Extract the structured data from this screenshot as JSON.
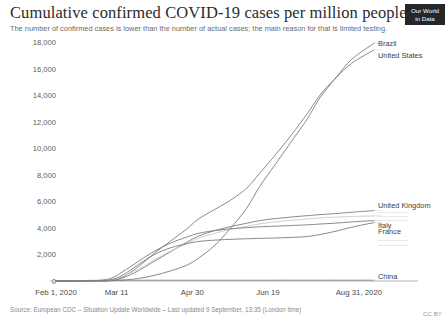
{
  "header": {
    "title": "Cumulative confirmed COVID-19 cases per million people",
    "subtitle": "The number of confirmed cases is lower than the number of actual cases; the main reason for that is limited testing.",
    "logo_line1": "Our World",
    "logo_line2": "in Data"
  },
  "footer": {
    "source": "Source: European CDC – Situation Update Worldwide – Last updated 9 September, 13:35 (London time)",
    "license": "CC BY"
  },
  "colors": {
    "line": "#7c7c7c",
    "axis": "#b5b5b5",
    "label": "#3d3d3d",
    "faded_label": "#d8d8d8",
    "logo_bg": "#23272c"
  },
  "chart_data": {
    "type": "line",
    "title": "Cumulative confirmed COVID-19 cases per million people",
    "subtitle": "The number of confirmed cases is lower than the number of actual cases; the main reason for that is limited testing.",
    "xlabel": "",
    "ylabel": "",
    "ylim": [
      0,
      18000
    ],
    "yticks": [
      0,
      2000,
      4000,
      6000,
      8000,
      10000,
      12000,
      14000,
      16000,
      18000
    ],
    "ytick_labels": [
      "0",
      "2,000",
      "4,000",
      "6,000",
      "8,000",
      "10,000",
      "12,000",
      "14,000",
      "16,000",
      "18,000"
    ],
    "xtick_labels": [
      "Feb 1, 2020",
      "Mar 11",
      "Apr 30",
      "Jun 19",
      "Aug 31, 2020"
    ],
    "xtick_positions": [
      0,
      0.1905,
      0.4286,
      0.6667,
      0.9524
    ],
    "x_start": "Feb 1, 2020",
    "x_end": "Aug 31, 2020",
    "grid": false,
    "legend_position": "right-inline",
    "series": [
      {
        "name": "Brazil",
        "label_value": 17900,
        "x": [
          0,
          0.06,
          0.12,
          0.17,
          0.21,
          0.26,
          0.31,
          0.36,
          0.41,
          0.45,
          0.5,
          0.55,
          0.6,
          0.64,
          0.69,
          0.74,
          0.79,
          0.83,
          0.88,
          0.93,
          1.0
        ],
        "values": [
          0,
          0,
          2,
          15,
          70,
          190,
          430,
          760,
          1180,
          1750,
          2700,
          4000,
          5500,
          7100,
          8800,
          10500,
          12200,
          13800,
          15300,
          16700,
          17900
        ]
      },
      {
        "name": "United States",
        "label_value": 17400,
        "x": [
          0,
          0.06,
          0.12,
          0.17,
          0.21,
          0.26,
          0.31,
          0.36,
          0.41,
          0.45,
          0.5,
          0.55,
          0.6,
          0.64,
          0.69,
          0.74,
          0.79,
          0.83,
          0.88,
          0.93,
          1.0
        ],
        "values": [
          0,
          0,
          3,
          40,
          300,
          1100,
          2100,
          3000,
          3900,
          4700,
          5400,
          6100,
          7000,
          8100,
          9500,
          11000,
          12600,
          14000,
          15300,
          16400,
          17400
        ]
      },
      {
        "name": "United Kingdom",
        "label_value": 5300,
        "x": [
          0,
          0.06,
          0.12,
          0.17,
          0.21,
          0.26,
          0.31,
          0.36,
          0.41,
          0.45,
          0.5,
          0.55,
          0.6,
          0.64,
          0.69,
          0.74,
          0.79,
          0.83,
          0.88,
          0.93,
          1.0
        ],
        "values": [
          0,
          0,
          2,
          30,
          230,
          780,
          1500,
          2200,
          2900,
          3400,
          3800,
          4100,
          4350,
          4550,
          4700,
          4820,
          4920,
          5000,
          5080,
          5180,
          5300
        ]
      },
      {
        "name": "",
        "label_value": 4900,
        "faded": true,
        "x": [
          0,
          0.06,
          0.12,
          0.17,
          0.21,
          0.26,
          0.31,
          0.36,
          0.41,
          0.45,
          0.5,
          0.55,
          0.6,
          0.64,
          0.69,
          0.74,
          0.79,
          0.83,
          0.88,
          0.93,
          1.0
        ],
        "values": [
          0,
          0,
          5,
          60,
          350,
          900,
          1600,
          2250,
          2800,
          3250,
          3600,
          3900,
          4120,
          4300,
          4450,
          4570,
          4670,
          4750,
          4810,
          4860,
          4900
        ]
      },
      {
        "name": "Italy",
        "label_value": 4550,
        "x": [
          0,
          0.06,
          0.12,
          0.17,
          0.21,
          0.26,
          0.31,
          0.36,
          0.41,
          0.45,
          0.5,
          0.55,
          0.6,
          0.64,
          0.69,
          0.74,
          0.79,
          0.83,
          0.88,
          0.93,
          1.0
        ],
        "values": [
          0,
          1,
          20,
          180,
          700,
          1500,
          2250,
          2850,
          3300,
          3600,
          3800,
          3930,
          4020,
          4080,
          4130,
          4180,
          4230,
          4290,
          4360,
          4450,
          4550
        ]
      },
      {
        "name": "France",
        "label_value": 4400,
        "x": [
          0,
          0.06,
          0.12,
          0.17,
          0.21,
          0.26,
          0.31,
          0.36,
          0.41,
          0.45,
          0.5,
          0.55,
          0.6,
          0.64,
          0.69,
          0.74,
          0.79,
          0.83,
          0.88,
          0.93,
          1.0
        ],
        "values": [
          0,
          0,
          6,
          80,
          450,
          1250,
          2000,
          2500,
          2800,
          2980,
          3080,
          3140,
          3180,
          3210,
          3240,
          3280,
          3350,
          3500,
          3750,
          4050,
          4400
        ]
      },
      {
        "name": "China",
        "label_value": 60,
        "x": [
          0,
          0.06,
          0.12,
          0.17,
          0.21,
          0.26,
          0.31,
          0.36,
          0.41,
          0.45,
          0.5,
          0.55,
          0.6,
          0.64,
          0.69,
          0.74,
          0.79,
          0.83,
          0.88,
          0.93,
          1.0
        ],
        "values": [
          8,
          30,
          50,
          56,
          57,
          58,
          58,
          58,
          58,
          59,
          59,
          59,
          59,
          59,
          60,
          60,
          60,
          60,
          60,
          60,
          60
        ]
      }
    ],
    "inline_labels": [
      {
        "name": "Brazil",
        "y": 17900,
        "faded": false
      },
      {
        "name": "United States",
        "y": 17000,
        "faded": false
      },
      {
        "name": "United Kingdom",
        "y": 5700,
        "faded": false
      },
      {
        "name": "",
        "y": 5250,
        "faded": true
      },
      {
        "name": "",
        "y": 4950,
        "faded": true
      },
      {
        "name": "",
        "y": 4650,
        "faded": true
      },
      {
        "name": "Italy",
        "y": 4200,
        "faded": false
      },
      {
        "name": "France",
        "y": 3750,
        "faded": false
      },
      {
        "name": "",
        "y": 3200,
        "faded": true
      },
      {
        "name": "",
        "y": 2800,
        "faded": true
      },
      {
        "name": "China",
        "y": 350,
        "faded": false
      }
    ]
  }
}
